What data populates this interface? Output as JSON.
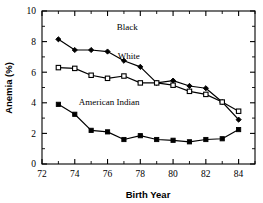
{
  "chart_data": {
    "type": "line",
    "title": "",
    "xlabel": "Birth Year",
    "ylabel": "Anemia (%)",
    "xlim": [
      72,
      85
    ],
    "ylim": [
      0,
      10
    ],
    "xticks": [
      72,
      74,
      76,
      78,
      80,
      82,
      84
    ],
    "xtick_labels": [
      "72",
      "74",
      "76",
      "78",
      "80",
      "82",
      "84"
    ],
    "xminor_ticks": [
      73,
      75,
      77,
      79,
      81,
      83,
      85
    ],
    "yticks": [
      0,
      2,
      4,
      6,
      8,
      10
    ],
    "ytick_labels": [
      "0",
      "2",
      "4",
      "6",
      "8",
      "10"
    ],
    "yminor_ticks": [
      1,
      3,
      5,
      7,
      9
    ],
    "grid": false,
    "legend_position": "inline-annotations",
    "x": [
      73,
      74,
      75,
      76,
      77,
      78,
      79,
      80,
      81,
      82,
      83,
      84
    ],
    "series": [
      {
        "name": "Black",
        "marker": "filled-diamond",
        "label_x": 77.2,
        "label_y": 8.75,
        "values": [
          8.15,
          7.45,
          7.45,
          7.35,
          6.75,
          6.35,
          5.3,
          5.45,
          5.1,
          4.95,
          4.05,
          2.9
        ]
      },
      {
        "name": "White",
        "marker": "open-square",
        "label_x": 77.3,
        "label_y": 6.85,
        "values": [
          6.3,
          6.25,
          5.8,
          5.6,
          5.75,
          5.3,
          5.3,
          5.15,
          4.75,
          4.55,
          4.05,
          3.45
        ]
      },
      {
        "name": "American Indian",
        "marker": "filled-square",
        "label_x": 76.1,
        "label_y": 3.85,
        "values": [
          3.9,
          3.25,
          2.2,
          2.1,
          1.6,
          1.85,
          1.6,
          1.55,
          1.45,
          1.6,
          1.65,
          2.25
        ]
      }
    ]
  }
}
